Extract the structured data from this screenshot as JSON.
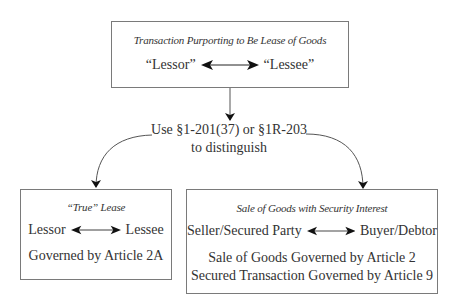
{
  "top_box": {
    "title": "Transaction Purporting to Be Lease of Goods",
    "left_party": "“Lessor”",
    "right_party": "“Lessee”"
  },
  "connector": {
    "line1": "Use §1-201(37) or §1R-203",
    "line2": "to distinguish"
  },
  "left_box": {
    "title": "“True” Lease",
    "left_party": "Lessor",
    "right_party": "Lessee",
    "governed": "Governed by Article 2A"
  },
  "right_box": {
    "title": "Sale of Goods with Security Interest",
    "left_party": "Seller/Secured Party",
    "right_party": "Buyer/Debtor",
    "governed_1": "Sale of Goods Governed by Article 2",
    "governed_2": "Secured Transaction Governed by Article 9"
  },
  "colors": {
    "line": "#555555",
    "border": "#7a7a7a",
    "text": "#333333"
  }
}
